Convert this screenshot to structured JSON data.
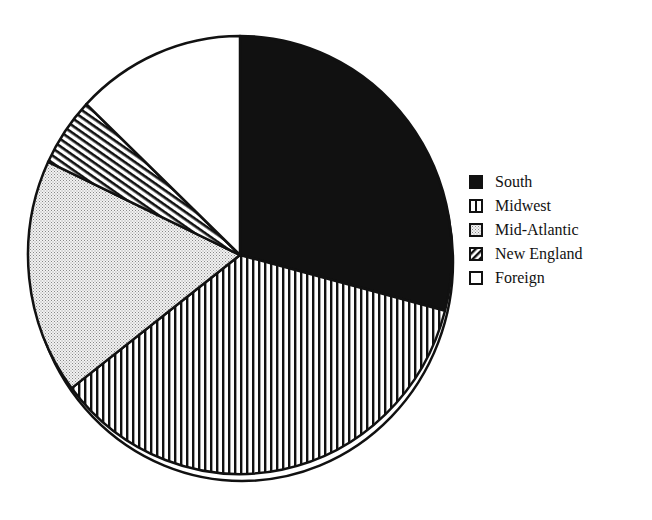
{
  "chart_data": {
    "type": "pie",
    "title": "",
    "start_angle_deg": 0,
    "direction": "clockwise",
    "categories": [
      "South",
      "Midwest",
      "Mid-Atlantic",
      "New England",
      "Foreign"
    ],
    "values": [
      29.1,
      35.5,
      17.4,
      5.1,
      12.9
    ],
    "unit": "percent (estimated from slice angles)",
    "patterns": [
      "solid-black",
      "vertical-stripes",
      "fine-dots",
      "diagonal-stripes",
      "white"
    ],
    "legend_position": "right",
    "has_shadow_offset_rim": true
  },
  "legend": {
    "items": [
      {
        "label": "South",
        "pattern": "solid-black"
      },
      {
        "label": "Midwest",
        "pattern": "vertical-stripes"
      },
      {
        "label": "Mid-Atlantic",
        "pattern": "fine-dots"
      },
      {
        "label": "New England",
        "pattern": "diagonal-stripes"
      },
      {
        "label": "Foreign",
        "pattern": "white"
      }
    ]
  },
  "colors": {
    "ink": "#111111",
    "background": "#ffffff"
  }
}
